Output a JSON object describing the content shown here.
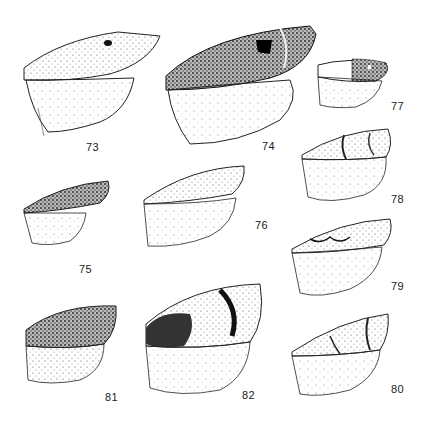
{
  "plate": {
    "description": "Plate of moth wing illustrations (forewing and hindwing), stippled pen drawings",
    "figures": [
      {
        "number": "73",
        "label_pos": [
          86,
          148
        ]
      },
      {
        "number": "74",
        "label_pos": [
          262,
          147
        ]
      },
      {
        "number": "75",
        "label_pos": [
          79,
          270
        ]
      },
      {
        "number": "76",
        "label_pos": [
          255,
          226
        ]
      },
      {
        "number": "77",
        "label_pos": [
          391,
          107
        ]
      },
      {
        "number": "78",
        "label_pos": [
          391,
          200
        ]
      },
      {
        "number": "79",
        "label_pos": [
          391,
          287
        ]
      },
      {
        "number": "80",
        "label_pos": [
          391,
          390
        ]
      },
      {
        "number": "81",
        "label_pos": [
          105,
          398
        ]
      },
      {
        "number": "82",
        "label_pos": [
          242,
          396
        ]
      }
    ]
  },
  "colors": {
    "ink": "#1a1a1a",
    "paper": "#ffffff",
    "stipple": "#555555"
  }
}
